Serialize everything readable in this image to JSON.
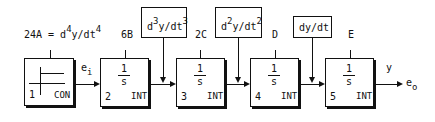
{
  "diagram": {
    "title_label": "24A = d",
    "title_sup1": "4",
    "title_mid": "y/dt",
    "title_sup2": "4",
    "blocks": [
      {
        "number": "1",
        "type": "CON",
        "tag": ""
      },
      {
        "number": "2",
        "type": "INT",
        "tag": "6B",
        "num": "1",
        "den": "s"
      },
      {
        "number": "3",
        "type": "INT",
        "tag": "2C",
        "num": "1",
        "den": "s"
      },
      {
        "number": "4",
        "type": "INT",
        "tag": "D",
        "num": "1",
        "den": "s"
      },
      {
        "number": "5",
        "type": "INT",
        "tag": "E",
        "num": "1",
        "den": "s"
      }
    ],
    "inputs": [
      {
        "pre": "d",
        "sup1": "3",
        "mid": "y/dt",
        "sup2": "3"
      },
      {
        "pre": "d",
        "sup1": "2",
        "mid": "y/dt",
        "sup2": "2"
      },
      {
        "text": "dy/dt"
      }
    ],
    "signals": {
      "ei_main": "e",
      "ei_sub": "i",
      "y": "y",
      "eo_main": "e",
      "eo_sub": "o"
    }
  }
}
